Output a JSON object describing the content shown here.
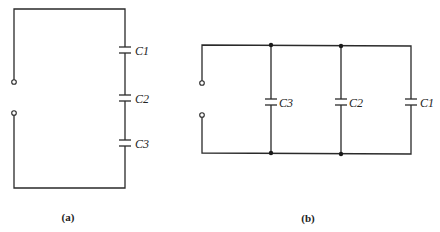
{
  "figure": {
    "panels": [
      {
        "id": "a",
        "label": "(a)",
        "configuration": "series",
        "capacitors": [
          "C1",
          "C2",
          "C3"
        ]
      },
      {
        "id": "b",
        "label": "(b)",
        "configuration": "parallel",
        "capacitors": [
          "C3",
          "C2",
          "C1"
        ]
      }
    ]
  }
}
